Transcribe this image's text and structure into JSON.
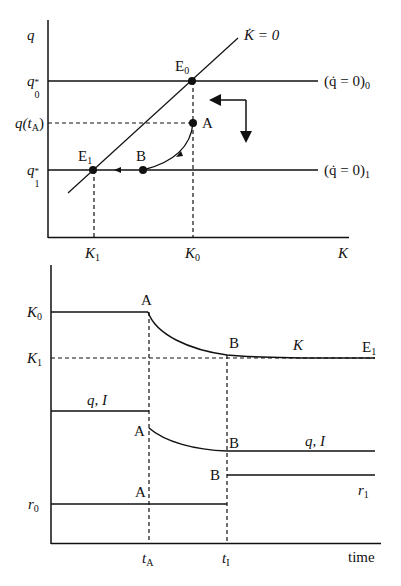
{
  "top_chart": {
    "y_axis_label": "q",
    "x_axis_label": "K",
    "y_ticks": [
      {
        "base": "q",
        "sub": "0",
        "sup": "*"
      },
      {
        "text": "q(t",
        "sub": "A",
        "after": ")"
      },
      {
        "base": "q",
        "sub": "1",
        "sup": "*"
      }
    ],
    "x_ticks": [
      {
        "base": "K",
        "sub": "1"
      },
      {
        "base": "K",
        "sub": "0"
      }
    ],
    "curves": {
      "k_dot_zero": "K̇ = 0",
      "q_dot_zero_0": {
        "text": "(q̇ = 0)",
        "sub": "0"
      },
      "q_dot_zero_1": {
        "text": "(q̇ = 0)",
        "sub": "1"
      }
    },
    "points": {
      "E0": {
        "base": "E",
        "sub": "0"
      },
      "E1": {
        "base": "E",
        "sub": "1"
      },
      "A": "A",
      "B": "B"
    }
  },
  "bottom_chart": {
    "x_axis_label": "time",
    "y_ticks": [
      {
        "base": "K",
        "sub": "0"
      },
      {
        "base": "K",
        "sub": "1"
      },
      {
        "base": "r",
        "sub": "0"
      }
    ],
    "x_ticks": [
      {
        "base": "t",
        "sub": "A"
      },
      {
        "base": "t",
        "sub": "I"
      }
    ],
    "series_labels": {
      "K": "K",
      "E1": {
        "base": "E",
        "sub": "1"
      },
      "qI_before": "q, I",
      "qI_after": "q, I",
      "r1": {
        "base": "r",
        "sub": "1"
      }
    },
    "point_labels": {
      "A_K": "A",
      "B_K": "B",
      "A_q": "A",
      "B_q": "B",
      "A_r": "A",
      "B_r": "B"
    }
  }
}
